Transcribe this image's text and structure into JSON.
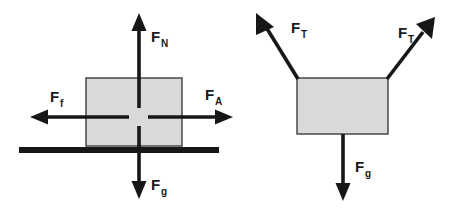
{
  "figure": {
    "background_color": "#ffffff",
    "line_color": "#171717",
    "block_fill_color": "#d9d9d9",
    "block_stroke_color": "#3d3d3d"
  },
  "diagrams": [
    {
      "name": "block-on-surface",
      "description": "Block resting on a horizontal surface with four forces",
      "block": {
        "x": 86,
        "y": 78,
        "width": 96,
        "height": 68
      },
      "ground": {
        "x": 19,
        "y": 147,
        "width": 200,
        "height": 6
      },
      "forces": [
        {
          "id": "normal",
          "symbol": "F",
          "subscript": "N",
          "direction": "up",
          "label_x": 151,
          "label_y": 42,
          "sub_dx": 10,
          "sub_dy": 5
        },
        {
          "id": "friction",
          "symbol": "F",
          "subscript": "f",
          "direction": "left",
          "label_x": 50,
          "label_y": 102,
          "sub_dx": 10,
          "sub_dy": 5
        },
        {
          "id": "applied",
          "symbol": "F",
          "subscript": "A",
          "direction": "right",
          "label_x": 205,
          "label_y": 100,
          "sub_dx": 10,
          "sub_dy": 5
        },
        {
          "id": "gravity",
          "symbol": "F",
          "subscript": "g",
          "direction": "down",
          "label_x": 151,
          "label_y": 190,
          "sub_dx": 10,
          "sub_dy": 5
        }
      ]
    },
    {
      "name": "hanging-block-two-tensions",
      "description": "Block suspended by two angled tension forces with weight below",
      "block": {
        "x": 297,
        "y": 78,
        "width": 91,
        "height": 56
      },
      "forces": [
        {
          "id": "tension-left",
          "symbol": "F",
          "subscript": "T",
          "direction": "up-left",
          "label_x": 291,
          "label_y": 33,
          "sub_dx": 10,
          "sub_dy": 5
        },
        {
          "id": "tension-right",
          "symbol": "F",
          "subscript": "T",
          "direction": "up-right",
          "label_x": 398,
          "label_y": 38,
          "sub_dx": 10,
          "sub_dy": 5
        },
        {
          "id": "gravity",
          "symbol": "F",
          "subscript": "g",
          "direction": "down",
          "label_x": 355,
          "label_y": 172,
          "sub_dx": 10,
          "sub_dy": 5
        }
      ]
    }
  ]
}
